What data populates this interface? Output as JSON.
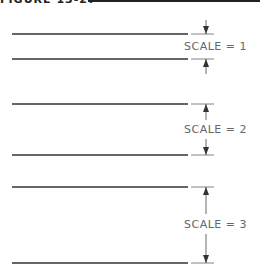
{
  "header": {
    "text": "FIGURE 13-27"
  },
  "blocks": [
    {
      "label": "SCALE  =  1",
      "top_y": 34,
      "bottom_y": 59,
      "label_y": 40
    },
    {
      "label": "SCALE  =  2",
      "top_y": 104,
      "bottom_y": 155,
      "label_y": 123
    },
    {
      "label": "SCALE  =  3",
      "top_y": 187,
      "bottom_y": 263,
      "label_y": 219
    }
  ],
  "colors": {
    "line": "#333333",
    "dimension": "#555555",
    "text": "#666666"
  }
}
